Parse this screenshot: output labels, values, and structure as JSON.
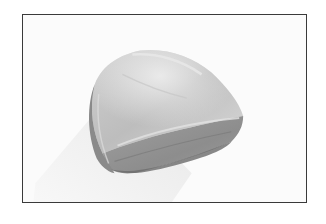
{
  "figure": {
    "alt": "Grayscale photograph of a raw cut of meat on a white background",
    "frame_color": "#3a3a3a",
    "background_color": "#fbfbfb",
    "tones": {
      "meat_light": "#d2d2d2",
      "meat_mid": "#a9a9a9",
      "meat_dark": "#7e7e7e",
      "meat_shadow_edge": "#666666",
      "fat_highlight": "#e6e6e6",
      "cast_shadow": "#ececec"
    }
  }
}
